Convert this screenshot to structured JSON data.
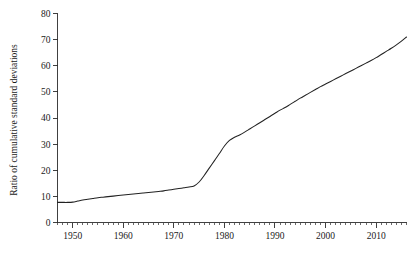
{
  "chart_data": {
    "type": "line",
    "title": "",
    "subtitle": "",
    "xlabel": "",
    "ylabel": "Ratio of cumulative standard deviations",
    "xlim": [
      1947,
      2016
    ],
    "ylim": [
      0,
      80
    ],
    "grid": false,
    "legend": "none",
    "x_tick_labels": [
      "1950",
      "1960",
      "1970",
      "1980",
      "1990",
      "2000",
      "2010"
    ],
    "x_tick_values": [
      1950,
      1960,
      1970,
      1980,
      1990,
      2000,
      2010
    ],
    "x_minor_tick_step": 1,
    "y_tick_labels": [
      "0",
      "10",
      "20",
      "30",
      "40",
      "50",
      "60",
      "70",
      "80"
    ],
    "y_tick_values": [
      0,
      10,
      20,
      30,
      40,
      50,
      60,
      70,
      80
    ],
    "line_color": "#222222",
    "background_color": "#ffffff",
    "series": [
      {
        "name": "Ratio of cumulative standard deviations",
        "x": [
          1947,
          1948,
          1949,
          1950,
          1951,
          1952,
          1953,
          1954,
          1955,
          1956,
          1957,
          1958,
          1959,
          1960,
          1961,
          1962,
          1963,
          1964,
          1965,
          1966,
          1967,
          1968,
          1969,
          1970,
          1971,
          1972,
          1973,
          1974,
          1975,
          1976,
          1977,
          1978,
          1979,
          1980,
          1981,
          1982,
          1983,
          1984,
          1985,
          1986,
          1987,
          1988,
          1989,
          1990,
          1991,
          1992,
          1993,
          1994,
          1995,
          1996,
          1997,
          1998,
          1999,
          2000,
          2001,
          2002,
          2003,
          2004,
          2005,
          2006,
          2007,
          2008,
          2009,
          2010,
          2011,
          2012,
          2013,
          2014,
          2015,
          2016
        ],
        "values": [
          7.7,
          7.7,
          7.7,
          7.8,
          8.2,
          8.6,
          8.9,
          9.2,
          9.5,
          9.7,
          9.9,
          10.1,
          10.3,
          10.5,
          10.7,
          10.9,
          11.1,
          11.3,
          11.5,
          11.7,
          11.9,
          12.1,
          12.4,
          12.7,
          13.0,
          13.3,
          13.6,
          14.0,
          15.5,
          18.0,
          20.8,
          23.6,
          26.4,
          29.3,
          31.4,
          32.6,
          33.5,
          34.6,
          35.8,
          37.0,
          38.2,
          39.4,
          40.6,
          41.8,
          43.0,
          44.0,
          45.2,
          46.4,
          47.6,
          48.7,
          49.8,
          50.9,
          52.0,
          53.0,
          54.0,
          55.0,
          56.0,
          57.0,
          58.0,
          59.0,
          60.0,
          61.0,
          62.0,
          63.1,
          64.3,
          65.5,
          66.7,
          68.0,
          69.4,
          71.0
        ]
      }
    ]
  }
}
